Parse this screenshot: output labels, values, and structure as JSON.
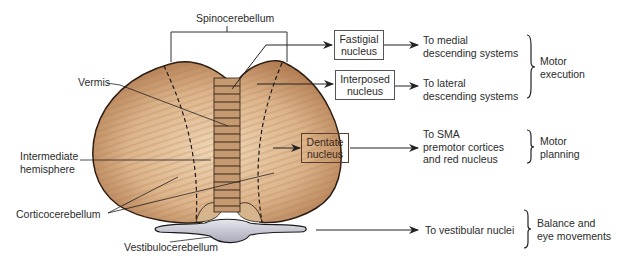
{
  "diagram": {
    "regions": {
      "spinocerebellum": "Spinocerebellum",
      "vermis": "Vermis",
      "intermediate_hemisphere": [
        "Intermediate",
        "hemisphere"
      ],
      "corticocerebellum": "Corticocerebellum",
      "vestibulocerebellum": "Vestibulocerebellum"
    },
    "nuclei": {
      "fastigial": [
        "Fastigial",
        "nucleus"
      ],
      "interposed": [
        "Interposed",
        "nucleus"
      ],
      "dentate": [
        "Dentate",
        "nucleus"
      ]
    },
    "outputs": {
      "medial": [
        "To medial",
        "descending systems"
      ],
      "lateral": [
        "To lateral",
        "descending systems"
      ],
      "sma": [
        "To SMA",
        "premotor cortices",
        "and red nucleus"
      ],
      "vestibular": "To vestibular nuclei"
    },
    "functions": {
      "motor_execution": [
        "Motor",
        "execution"
      ],
      "motor_planning": [
        "Motor",
        "planning"
      ],
      "balance": [
        "Balance and",
        "eye movements"
      ]
    },
    "colors": {
      "cerebellum_light": "#e8cba6",
      "cerebellum_mid": "#cfa57c",
      "cerebellum_dark": "#a8744c",
      "outline": "#2a1a10",
      "vestibulo": "#c9c9d4"
    }
  }
}
